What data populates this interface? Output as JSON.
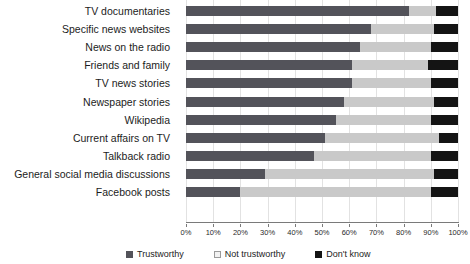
{
  "chart_data": {
    "type": "bar",
    "orientation": "horizontal",
    "stacked": true,
    "normalized": true,
    "title": "",
    "subtitle": "",
    "xlabel": "",
    "ylabel": "",
    "xlim": [
      0,
      100
    ],
    "grid": true,
    "legend_position": "bottom",
    "xticks": [
      0,
      10,
      20,
      30,
      40,
      50,
      60,
      70,
      80,
      90,
      100
    ],
    "xticklabels": [
      "0%",
      "10%",
      "20%",
      "30%",
      "40%",
      "50%",
      "60%",
      "70%",
      "80%",
      "90%",
      "100%"
    ],
    "categories": [
      "TV documentaries",
      "Specific news websites",
      "News on the radio",
      "Friends and family",
      "TV news stories",
      "Newspaper stories",
      "Wikipedia",
      "Current affairs on TV",
      "Talkback radio",
      "General social media discussions",
      "Facebook posts"
    ],
    "series": [
      {
        "name": "Trustworthy",
        "color": "#53535a",
        "values": [
          82,
          68,
          64,
          61,
          61,
          58,
          55,
          51,
          47,
          29,
          20
        ]
      },
      {
        "name": "Not trustworthy",
        "color": "#c9c9c9",
        "values": [
          10,
          23,
          26,
          28,
          29,
          33,
          35,
          42,
          43,
          62,
          70
        ]
      },
      {
        "name": "Don't know",
        "color": "#141414",
        "values": [
          8,
          9,
          10,
          11,
          10,
          9,
          10,
          7,
          10,
          9,
          10
        ]
      }
    ]
  },
  "legend": {
    "items": [
      {
        "label": "Trustworthy",
        "swatch": "legend-swatch-trustworthy"
      },
      {
        "label": "Not trustworthy",
        "swatch": "legend-swatch-not-trustworthy"
      },
      {
        "label": "Don't know",
        "swatch": "legend-swatch-dont-know"
      }
    ]
  },
  "colors": {
    "trustworthy": "#53535a",
    "not_trustworthy": "#c9c9c9",
    "dont_know": "#141414",
    "grid": "#e2e2e2",
    "axis": "#7a7a7a",
    "background": "#ffffff"
  }
}
